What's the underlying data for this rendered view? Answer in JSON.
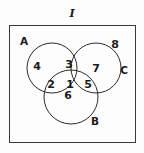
{
  "figure": {
    "type": "venn-diagram",
    "universe_label": "I",
    "set_labels": [
      {
        "name": "A",
        "text": "A",
        "x": 24,
        "y": 41
      },
      {
        "name": "B",
        "text": "B",
        "x": 95,
        "y": 121
      },
      {
        "name": "C",
        "text": "C",
        "x": 124,
        "y": 70
      }
    ],
    "region_labels": [
      {
        "name": "region-1",
        "text": "1",
        "region": "A-and-B-and-C",
        "x": 70,
        "y": 84
      },
      {
        "name": "region-2",
        "text": "2",
        "region": "A-and-B-only",
        "x": 51,
        "y": 84
      },
      {
        "name": "region-3",
        "text": "3",
        "region": "A-and-C-only",
        "x": 69,
        "y": 64
      },
      {
        "name": "region-4",
        "text": "4",
        "region": "A-only",
        "x": 37,
        "y": 66
      },
      {
        "name": "region-5",
        "text": "5",
        "region": "B-and-C-only",
        "x": 88,
        "y": 84
      },
      {
        "name": "region-6",
        "text": "6",
        "region": "B-only",
        "x": 68,
        "y": 95
      },
      {
        "name": "region-7",
        "text": "7",
        "region": "C-only",
        "x": 96,
        "y": 68
      },
      {
        "name": "region-8",
        "text": "8",
        "region": "outside-all-sets",
        "x": 115,
        "y": 44
      }
    ],
    "universe_label_pos": {
      "x": 72,
      "y": 13
    },
    "rectangle": {
      "x": 9,
      "y": 25,
      "width": 127,
      "height": 118
    },
    "circles": [
      {
        "name": "circle-A",
        "cx": 52,
        "cy": 68,
        "r": 25
      },
      {
        "name": "circle-B",
        "cx": 71,
        "cy": 97,
        "r": 27
      },
      {
        "name": "circle-C",
        "cx": 96,
        "cy": 68,
        "r": 25
      }
    ],
    "colors": {
      "stroke": "#2b2b2b",
      "text": "#1a1a1a",
      "background": "#fdfdfd"
    }
  }
}
